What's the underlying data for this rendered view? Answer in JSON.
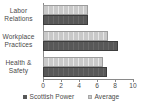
{
  "chart_data": {
    "type": "bar",
    "orientation": "horizontal",
    "title": "",
    "subtitle": "",
    "xlabel": "",
    "ylabel": "",
    "categories": [
      "Labor Relations",
      "Workplace Practices",
      "Health & Safety"
    ],
    "category_lines": [
      [
        "Labor",
        "Relations"
      ],
      [
        "Workplace",
        "Practices"
      ],
      [
        "Health &",
        "Safety"
      ]
    ],
    "series": [
      {
        "name": "Scottish Power",
        "values": [
          5.0,
          8.3,
          7.1
        ],
        "color": "#585858"
      },
      {
        "name": "Average",
        "values": [
          5.0,
          7.2,
          6.7
        ],
        "color": "#c9c9c9"
      }
    ],
    "xlim": [
      0,
      10
    ],
    "xticks": [
      0,
      2,
      4,
      6,
      8,
      10
    ],
    "xtick_labels": [
      "0",
      "2",
      "4",
      "6",
      "8",
      "10"
    ],
    "grid": false,
    "legend_position": "bottom"
  },
  "legend": {
    "entries": [
      {
        "label": "Scottish Power",
        "swatch": "legend-swatch-scottish-power"
      },
      {
        "label": "Average",
        "swatch": "legend-swatch-average"
      }
    ]
  },
  "axis": {
    "x_tick_labels": [
      "0",
      "2",
      "4",
      "6",
      "8",
      "10"
    ]
  },
  "colors": {
    "scottish_power": "#585858",
    "average": "#c9c9c9",
    "axis": "#8a8a8a",
    "text": "#4a4a4a",
    "background": "#ffffff"
  }
}
